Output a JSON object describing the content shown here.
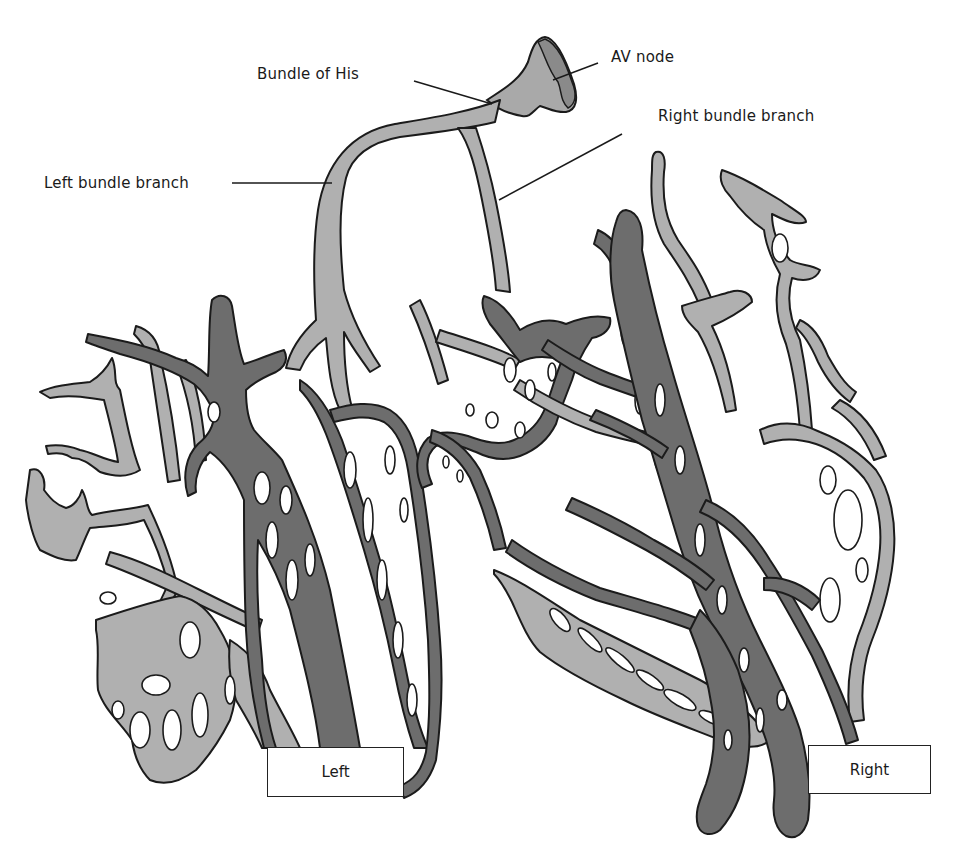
{
  "figure": {
    "colors": {
      "background": "#ffffff",
      "light_tissue": "#b0b0b0",
      "dark_tissue": "#6d6d6d",
      "outline": "#1b1b1b"
    }
  },
  "labels": {
    "av_node": "AV node",
    "bundle_of_his": "Bundle of His",
    "right_bundle_branch": "Right bundle branch",
    "left_bundle_branch": "Left bundle branch"
  },
  "boxes": {
    "left": "Left",
    "right": "Right"
  }
}
